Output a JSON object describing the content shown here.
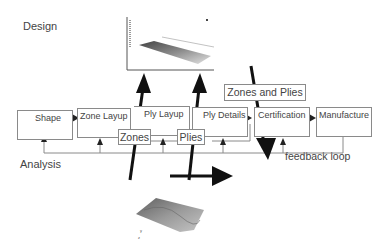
{
  "labels": {
    "design": "Design",
    "analysis": "Analysis",
    "feedback": "feedback loop"
  },
  "process_steps": [
    {
      "label": "Shape"
    },
    {
      "label": "Zone Layup"
    },
    {
      "label": "Ply Layup"
    },
    {
      "label": "Ply Details"
    },
    {
      "label": "Certification"
    },
    {
      "label": "Manufacture"
    }
  ],
  "callouts": {
    "zones": "Zones",
    "plies": "Plies",
    "zones_and_plies": "Zones and Plies"
  },
  "colors": {
    "arrow": "#111111",
    "box_border": "#8a8a8a",
    "line": "#8a8a8a"
  }
}
